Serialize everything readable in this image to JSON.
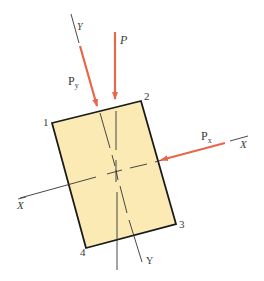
{
  "diagram": {
    "colors": {
      "section_fill": "#fbeab4",
      "section_stroke": "#1a1a1a",
      "force_arrow": "#e8674a",
      "axis_line": "#333333",
      "label": "#3a3a3a"
    },
    "labels": {
      "load": "P",
      "load_y_component": "P",
      "load_y_sub": "y",
      "load_x_component": "P",
      "load_x_sub": "x",
      "axis_y_top": "Y",
      "axis_y_bottom": "Y",
      "axis_x_left": "X",
      "axis_x_right": "X",
      "corner_1": "1",
      "corner_2": "2",
      "corner_3": "3",
      "corner_4": "4"
    }
  }
}
